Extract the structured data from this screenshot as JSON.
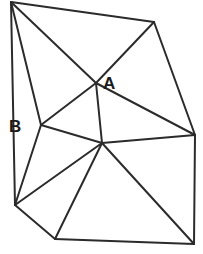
{
  "figure": {
    "kind": "geometry-diagram",
    "canvas": {
      "width": 203,
      "height": 254
    },
    "background_color": "#ffffff",
    "stroke_color": "#2b2b2b",
    "stroke_width": 2,
    "fill_color": "#ffffff"
  },
  "labels": [
    {
      "id": "A",
      "text": "A",
      "x": 103,
      "y": 75,
      "color": "#1a1a1a",
      "bold": true
    },
    {
      "id": "B",
      "text": "B",
      "x": 9,
      "y": 118,
      "color": "#1a1a1a",
      "bold": true
    }
  ],
  "chart_data": {
    "type": "scatter",
    "title": "",
    "xlabel": "",
    "ylabel": "",
    "grid": false,
    "legend": "none",
    "xlim": [
      0,
      203
    ],
    "ylim": [
      0,
      254
    ],
    "points": [
      {
        "name": "P1",
        "label": "",
        "x": 11,
        "y": 2
      },
      {
        "name": "P2",
        "label": "",
        "x": 154,
        "y": 22
      },
      {
        "name": "P3",
        "label": "",
        "x": 195,
        "y": 135
      },
      {
        "name": "P4",
        "label": "",
        "x": 194,
        "y": 244
      },
      {
        "name": "P5",
        "label": "",
        "x": 55,
        "y": 239
      },
      {
        "name": "P6",
        "label": "",
        "x": 15,
        "y": 205
      },
      {
        "name": "PA",
        "label": "A",
        "x": 96,
        "y": 83
      },
      {
        "name": "PB",
        "label": "B",
        "x": 41,
        "y": 125
      },
      {
        "name": "PC",
        "label": "",
        "x": 102,
        "y": 143
      }
    ],
    "segments": [
      {
        "from": "P1",
        "to": "P2",
        "kind": "outline"
      },
      {
        "from": "P2",
        "to": "P3",
        "kind": "outline"
      },
      {
        "from": "P3",
        "to": "P4",
        "kind": "outline"
      },
      {
        "from": "P4",
        "to": "P5",
        "kind": "outline"
      },
      {
        "from": "P5",
        "to": "P6",
        "kind": "outline"
      },
      {
        "from": "P6",
        "to": "P1",
        "kind": "outline"
      },
      {
        "from": "P1",
        "to": "PA",
        "kind": "interior"
      },
      {
        "from": "P2",
        "to": "PA",
        "kind": "interior"
      },
      {
        "from": "PA",
        "to": "PB",
        "kind": "interior"
      },
      {
        "from": "PA",
        "to": "PC",
        "kind": "interior"
      },
      {
        "from": "PA",
        "to": "P3",
        "kind": "interior"
      },
      {
        "from": "PB",
        "to": "PC",
        "kind": "interior"
      },
      {
        "from": "PB",
        "to": "P1",
        "kind": "interior"
      },
      {
        "from": "PB",
        "to": "P6",
        "kind": "interior"
      },
      {
        "from": "PC",
        "to": "P3",
        "kind": "interior"
      },
      {
        "from": "PC",
        "to": "P4",
        "kind": "interior"
      },
      {
        "from": "PC",
        "to": "P5",
        "kind": "interior"
      },
      {
        "from": "PC",
        "to": "P6",
        "kind": "interior"
      }
    ]
  }
}
